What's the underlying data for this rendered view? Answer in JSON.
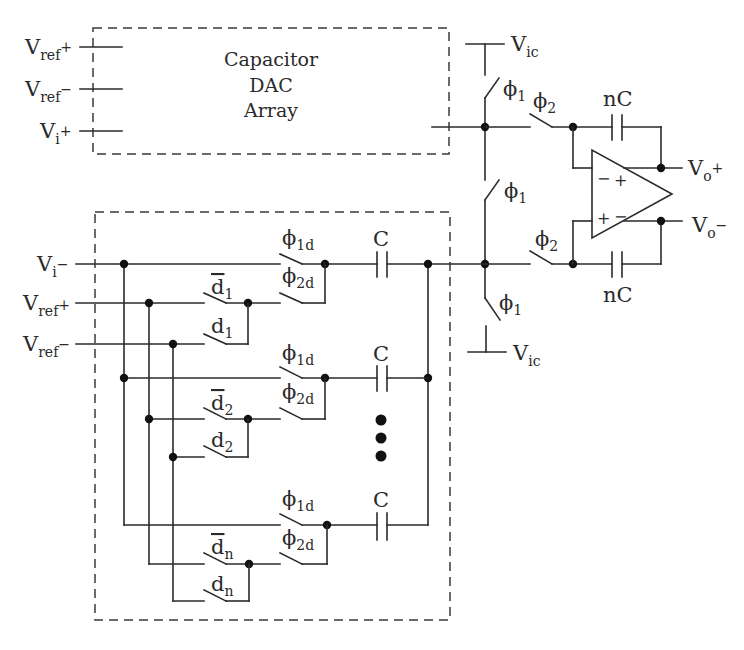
{
  "diagram": {
    "type": "circuit-schematic",
    "dac_block": {
      "line1": "Capacitor",
      "line2": "DAC",
      "line3": "Array",
      "inputs": [
        {
          "main": "V",
          "sub": "ref",
          "suffix": "+"
        },
        {
          "main": "V",
          "sub": "ref",
          "suffix": "−"
        },
        {
          "main": "V",
          "sub": "i",
          "suffix": "+"
        }
      ]
    },
    "lower_block": {
      "inputs": [
        {
          "main": "V",
          "sub": "i",
          "suffix": "−"
        },
        {
          "main": "V",
          "sub": "ref",
          "suffix": "+"
        },
        {
          "main": "V",
          "sub": "ref",
          "suffix": "−"
        }
      ],
      "rows": [
        {
          "phi1": "ϕ",
          "phi1_sub": "1d",
          "phi2": "ϕ",
          "phi2_sub": "2d",
          "dbar": "d",
          "dbar_sub": "1",
          "d": "d",
          "d_sub": "1",
          "cap": "C"
        },
        {
          "phi1": "ϕ",
          "phi1_sub": "1d",
          "phi2": "ϕ",
          "phi2_sub": "2d",
          "dbar": "d",
          "dbar_sub": "2",
          "d": "d",
          "d_sub": "2",
          "cap": "C"
        },
        {
          "phi1": "ϕ",
          "phi1_sub": "1d",
          "phi2": "ϕ",
          "phi2_sub": "2d",
          "dbar": "d",
          "dbar_sub": "n",
          "d": "d",
          "d_sub": "n",
          "cap": "C"
        }
      ]
    },
    "common_mode": {
      "vic_main": "V",
      "vic_sub": "ic",
      "phi1_main": "ϕ",
      "phi1_sub": "1"
    },
    "amp": {
      "phi2_main": "ϕ",
      "phi2_sub": "2",
      "feedback_cap": "nC",
      "in_top_minus": "−",
      "in_top_plus": "+",
      "in_bot_plus": "+",
      "in_bot_minus": "−",
      "out_pos": {
        "main": "V",
        "sub": "o",
        "suffix": "+"
      },
      "out_neg": {
        "main": "V",
        "sub": "o",
        "suffix": "−"
      }
    }
  }
}
